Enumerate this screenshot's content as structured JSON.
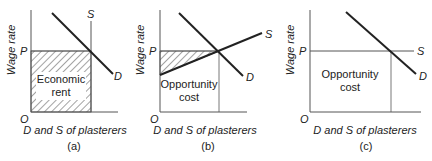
{
  "panels": [
    {
      "id": "a",
      "caption": "(a)",
      "y_label": "Wage rate",
      "x_label": "D and S of plasterers",
      "origin": "O",
      "price_label": "P",
      "supply_label": "S",
      "demand_label": "D",
      "area_label_line1": "Economic",
      "area_label_line2": "rent",
      "supply_type": "vertical (perfectly inelastic)",
      "shaded_region": "Economic rent (entire rectangle below P)"
    },
    {
      "id": "b",
      "caption": "(b)",
      "y_label": "Wage rate",
      "x_label": "D and S of plasterers",
      "origin": "O",
      "price_label": "P",
      "supply_label": "S",
      "demand_label": "D",
      "area_label_line1": "Opportunity",
      "area_label_line2": "cost",
      "supply_type": "upward sloping",
      "shaded_region": "Economic rent (triangle between P and S)"
    },
    {
      "id": "c",
      "caption": "(c)",
      "y_label": "Wage rate",
      "x_label": "D and S of plasterers",
      "origin": "O",
      "price_label": "P",
      "supply_label": "S",
      "demand_label": "D",
      "area_label_line1": "Opportunity",
      "area_label_line2": "cost",
      "supply_type": "horizontal (perfectly elastic)",
      "shaded_region": "none"
    }
  ],
  "colors": {
    "line": "#222222",
    "thin_line": "#555555",
    "hatch": "#333333",
    "background": "#ffffff"
  }
}
